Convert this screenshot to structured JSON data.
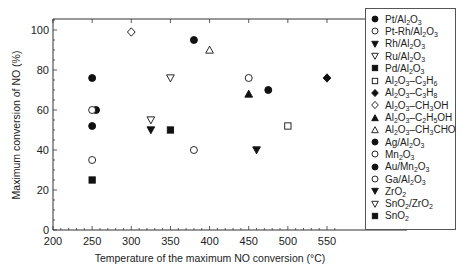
{
  "chart_data": {
    "type": "scatter",
    "title": "",
    "xlabel": "Temperature of the maximum NO conversion (°C)",
    "ylabel": "Maximum conversion of NO (%)",
    "xlim": [
      200,
      560
    ],
    "ylim": [
      0,
      105
    ],
    "xticks": [
      200,
      250,
      300,
      350,
      400,
      450,
      500,
      550
    ],
    "yticks": [
      0,
      20,
      40,
      60,
      80,
      100
    ],
    "grid": false,
    "legend_position": "right",
    "series": [
      {
        "name": "Pt/Al2O3",
        "label_html": "Pt/Al<sub>2</sub>O<sub>3</sub>",
        "marker": "circle",
        "filled": true,
        "points": [
          [
            250,
            76
          ],
          [
            255,
            60
          ],
          [
            250,
            52
          ]
        ]
      },
      {
        "name": "Pt-Rh/Al2O3",
        "label_html": "Pt-Rh/Al<sub>2</sub>O<sub>3</sub>",
        "marker": "circle",
        "filled": false,
        "points": [
          [
            250,
            60
          ]
        ]
      },
      {
        "name": "Rh/Al2O3",
        "label_html": "Rh/Al<sub>2</sub>O<sub>3</sub>",
        "marker": "triangle-down",
        "filled": true,
        "points": [
          [
            325,
            50
          ]
        ]
      },
      {
        "name": "Ru/Al2O3",
        "label_html": "Ru/Al<sub>2</sub>O<sub>3</sub>",
        "marker": "triangle-down",
        "filled": false,
        "points": [
          [
            325,
            55
          ],
          [
            350,
            76
          ]
        ]
      },
      {
        "name": "Pd/Al2O3",
        "label_html": "Pd/Al<sub>2</sub>O<sub>3</sub>",
        "marker": "square",
        "filled": true,
        "points": [
          [
            350,
            50
          ]
        ]
      },
      {
        "name": "Al2O3–C3H6",
        "label_html": "Al<sub>2</sub>O<sub>3</sub>–C<sub>3</sub>H<sub>6</sub>",
        "marker": "square",
        "filled": false,
        "points": [
          [
            500,
            52
          ]
        ]
      },
      {
        "name": "Al2O3–C3H8",
        "label_html": "Al<sub>2</sub>O<sub>3</sub>–C<sub>3</sub>H<sub>8</sub>",
        "marker": "diamond",
        "filled": true,
        "points": [
          [
            550,
            76
          ]
        ]
      },
      {
        "name": "Al2O3–CH3OH",
        "label_html": "Al<sub>2</sub>O<sub>3</sub>–CH<sub>3</sub>OH",
        "marker": "diamond",
        "filled": false,
        "points": [
          [
            300,
            99
          ]
        ]
      },
      {
        "name": "Al2O3–C2H5OH",
        "label_html": "Al<sub>2</sub>O<sub>3</sub>–C<sub>2</sub>H<sub>5</sub>OH",
        "marker": "triangle-up",
        "filled": true,
        "points": [
          [
            450,
            68
          ]
        ]
      },
      {
        "name": "Al2O3–CH3CHO",
        "label_html": "Al<sub>2</sub>O<sub>3</sub>–CH<sub>3</sub>CHO",
        "marker": "triangle-up",
        "filled": false,
        "points": [
          [
            400,
            90
          ]
        ]
      },
      {
        "name": "Ag/Al2O3",
        "label_html": "Ag/Al<sub>2</sub>O<sub>3</sub>",
        "marker": "circle",
        "filled": true,
        "points": [
          [
            380,
            95
          ]
        ]
      },
      {
        "name": "Mn2O3",
        "label_html": "Mn<sub>2</sub>O<sub>3</sub>",
        "marker": "circle",
        "filled": false,
        "points": [
          [
            380,
            40
          ]
        ]
      },
      {
        "name": "Au/Mn2O3",
        "label_html": "Au/Mn<sub>2</sub>O<sub>3</sub>",
        "marker": "circle",
        "filled": true,
        "points": [
          [
            475,
            70
          ]
        ]
      },
      {
        "name": "Ga/Al2O3",
        "label_html": "Ga/Al<sub>2</sub>O<sub>3</sub>",
        "marker": "circle",
        "filled": false,
        "points": [
          [
            450,
            76
          ],
          [
            250,
            35
          ]
        ]
      },
      {
        "name": "ZrO2",
        "label_html": "ZrO<sub>2</sub>",
        "marker": "triangle-down",
        "filled": true,
        "points": [
          [
            460,
            40
          ]
        ]
      },
      {
        "name": "SnO2/ZrO2",
        "label_html": "SnO<sub>2</sub>/ZrO<sub>2</sub>",
        "marker": "triangle-down",
        "filled": false,
        "points": []
      },
      {
        "name": "SnO2",
        "label_html": "SnO<sub>2</sub>",
        "marker": "square",
        "filled": true,
        "points": [
          [
            250,
            25
          ]
        ]
      }
    ]
  },
  "colors": {
    "marker": "#111111",
    "axis": "#333333",
    "background": "#ffffff"
  }
}
